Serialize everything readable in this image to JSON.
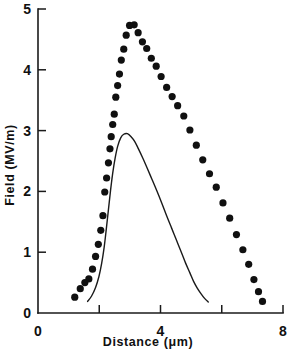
{
  "chart_data": {
    "type": "scatter",
    "title": "",
    "xlabel": "Distance (μm)",
    "ylabel": "Field (MV/m)",
    "xlim": [
      0,
      8
    ],
    "ylim": [
      0,
      5
    ],
    "grid": false,
    "legend": "none",
    "x_tick_labels": [
      "0",
      "4",
      "8"
    ],
    "x_tick_values": [
      0,
      4,
      8
    ],
    "x_minor_tick_values": [
      2,
      6
    ],
    "y_tick_labels": [
      "0",
      "1",
      "2",
      "3",
      "4",
      "5"
    ],
    "y_tick_values": [
      0,
      1,
      2,
      3,
      4,
      5
    ],
    "y_origin_label": "0",
    "x_origin_label": "0",
    "series": [
      {
        "name": "measured-points",
        "style": "filled-circles",
        "marker": "circle",
        "color": "#101010",
        "points": [
          [
            1.2,
            0.26
          ],
          [
            1.38,
            0.4
          ],
          [
            1.53,
            0.5
          ],
          [
            1.66,
            0.56
          ],
          [
            1.78,
            0.72
          ],
          [
            1.88,
            0.93
          ],
          [
            1.97,
            1.13
          ],
          [
            2.05,
            1.36
          ],
          [
            2.12,
            1.6
          ],
          [
            2.18,
            1.99
          ],
          [
            2.24,
            2.22
          ],
          [
            2.3,
            2.47
          ],
          [
            2.35,
            2.7
          ],
          [
            2.39,
            2.9
          ],
          [
            2.44,
            3.1
          ],
          [
            2.49,
            3.27
          ],
          [
            2.54,
            3.55
          ],
          [
            2.6,
            3.74
          ],
          [
            2.66,
            3.93
          ],
          [
            2.72,
            4.16
          ],
          [
            2.8,
            4.34
          ],
          [
            2.88,
            4.57
          ],
          [
            2.99,
            4.73
          ],
          [
            3.14,
            4.74
          ],
          [
            3.27,
            4.61
          ],
          [
            3.41,
            4.46
          ],
          [
            3.55,
            4.35
          ],
          [
            3.7,
            4.19
          ],
          [
            3.86,
            4.06
          ],
          [
            4.02,
            3.89
          ],
          [
            4.2,
            3.71
          ],
          [
            4.38,
            3.56
          ],
          [
            4.56,
            3.41
          ],
          [
            4.76,
            3.24
          ],
          [
            4.96,
            3.01
          ],
          [
            5.17,
            2.76
          ],
          [
            5.38,
            2.52
          ],
          [
            5.6,
            2.29
          ],
          [
            5.82,
            2.07
          ],
          [
            6.04,
            1.81
          ],
          [
            6.26,
            1.56
          ],
          [
            6.48,
            1.29
          ],
          [
            6.69,
            1.04
          ],
          [
            6.88,
            0.8
          ],
          [
            7.05,
            0.55
          ],
          [
            7.2,
            0.35
          ],
          [
            7.33,
            0.19
          ]
        ]
      },
      {
        "name": "model-curve",
        "style": "solid-line",
        "marker": "none",
        "color": "#1a1a1a",
        "points": [
          [
            1.62,
            0.19
          ],
          [
            1.75,
            0.28
          ],
          [
            1.88,
            0.42
          ],
          [
            1.99,
            0.6
          ],
          [
            2.08,
            0.82
          ],
          [
            2.16,
            1.08
          ],
          [
            2.23,
            1.38
          ],
          [
            2.3,
            1.7
          ],
          [
            2.37,
            2.02
          ],
          [
            2.44,
            2.3
          ],
          [
            2.52,
            2.55
          ],
          [
            2.6,
            2.74
          ],
          [
            2.7,
            2.88
          ],
          [
            2.8,
            2.94
          ],
          [
            2.92,
            2.95
          ],
          [
            3.04,
            2.9
          ],
          [
            3.16,
            2.82
          ],
          [
            3.28,
            2.7
          ],
          [
            3.42,
            2.55
          ],
          [
            3.56,
            2.39
          ],
          [
            3.72,
            2.2
          ],
          [
            3.88,
            2.01
          ],
          [
            4.04,
            1.81
          ],
          [
            4.2,
            1.6
          ],
          [
            4.36,
            1.4
          ],
          [
            4.52,
            1.2
          ],
          [
            4.68,
            1.0
          ],
          [
            4.82,
            0.82
          ],
          [
            4.96,
            0.66
          ],
          [
            5.08,
            0.52
          ],
          [
            5.2,
            0.41
          ],
          [
            5.32,
            0.32
          ],
          [
            5.44,
            0.24
          ],
          [
            5.56,
            0.18
          ]
        ]
      }
    ]
  }
}
